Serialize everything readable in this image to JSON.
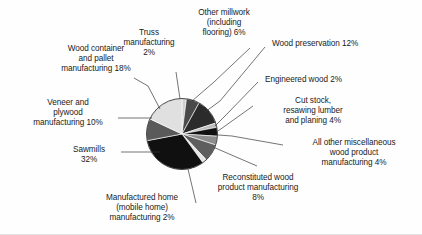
{
  "chart_data": {
    "type": "pie",
    "title": "",
    "subtitle": "",
    "xlabel": "",
    "ylabel": "",
    "legend_position": "none",
    "grid": false,
    "units": "percent",
    "total": 100,
    "categories": [
      "Truss manufacturing",
      "Other millwork (including flooring)",
      "Wood preservation",
      "Engineered wood",
      "Cut stock, resawing lumber and planing",
      "All other miscellaneous wood product manufacturing",
      "Reconstituted wood product manufacturing",
      "Manufactured home (mobile home) manufacturing",
      "Sawmills",
      "Veneer and plywood manufacturing",
      "Wood container and pallet manufacturing"
    ],
    "values": [
      2,
      6,
      12,
      2,
      4,
      4,
      8,
      2,
      32,
      10,
      18
    ],
    "slices": [
      {
        "label": "Truss manufacturing",
        "value": 2,
        "color": "#d0d0d0"
      },
      {
        "label": "Other millwork (including flooring)",
        "value": 6,
        "color": "#4a4a4a"
      },
      {
        "label": "Wood preservation",
        "value": 12,
        "color": "#2b2b2b"
      },
      {
        "label": "Engineered wood",
        "value": 2,
        "color": "#bdbdbd"
      },
      {
        "label": "Cut stock, resawing lumber and planing",
        "value": 4,
        "color": "#111111"
      },
      {
        "label": "All other miscellaneous wood product manufacturing",
        "value": 4,
        "color": "#8c8c8c"
      },
      {
        "label": "Reconstituted wood product manufacturing",
        "value": 8,
        "color": "#5e5e5e"
      },
      {
        "label": "Manufactured home (mobile home) manufacturing",
        "value": 2,
        "color": "#e6e6e6"
      },
      {
        "label": "Sawmills",
        "value": 32,
        "color": "#101010"
      },
      {
        "label": "Veneer and plywood manufacturing",
        "value": 10,
        "color": "#5a5a5a"
      },
      {
        "label": "Wood container and pallet manufacturing",
        "value": 18,
        "color": "#e0e0e0"
      }
    ]
  },
  "labels": {
    "truss": "Truss\nmanufacturing\n2%",
    "other_millwork": "Other millwork\n(including\nflooring) 6%",
    "wood_preservation": "Wood preservation 12%",
    "engineered_wood": "Engineered wood 2%",
    "cut_stock": "Cut stock,\nresawing lumber\nand planing 4%",
    "all_other_misc": "All other miscellaneous\nwood product\nmanufacturing 4%",
    "reconstituted": "Reconstituted wood\nproduct manufacturing\n8%",
    "manufactured_home": "Manufactured home\n(mobile home)\nmanufacturing 2%",
    "sawmills": "Sawmills\n32%",
    "veneer_plywood": "Veneer and\nplywood\nmanufacturing 10%",
    "wood_container": "Wood container\nand pallet\nmanufacturing 18%"
  }
}
